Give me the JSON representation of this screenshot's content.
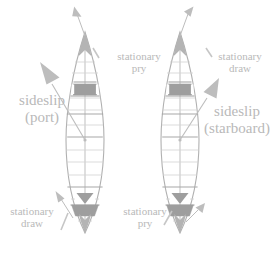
{
  "figure": {
    "colors": {
      "hull_outline": "#b0b0b0",
      "rib_line": "#c9c9c9",
      "thwart_line": "#a8a8a8",
      "seat_fill": "#9e9e9e",
      "arrow": "#bdbdbd",
      "text": "#b9b9b9",
      "background": "#ffffff"
    }
  },
  "labels": {
    "left_top": {
      "line1": "stationary",
      "line2": "pry"
    },
    "left_middle": {
      "line1": "sideslip",
      "line2": "(port)"
    },
    "left_bottom": {
      "line1": "stationary",
      "line2": "draw"
    },
    "right_top": {
      "line1": "stationary",
      "line2": "draw"
    },
    "right_middle": {
      "line1": "sideslip",
      "line2": "(starboard)"
    },
    "right_bottom": {
      "line1": "stationary",
      "line2": "pry"
    }
  },
  "canoes": [
    {
      "id": "left-canoe",
      "side": "port",
      "bow_heading": "up",
      "sideslip_direction": "up-left",
      "bow_stroke": "stationary pry",
      "stern_stroke": "stationary draw"
    },
    {
      "id": "right-canoe",
      "side": "starboard",
      "bow_heading": "up",
      "sideslip_direction": "up-right",
      "bow_stroke": "stationary draw",
      "stern_stroke": "stationary pry"
    }
  ],
  "arrows": {
    "left_momentum": {
      "name": "momentum-arrow-left",
      "direction": "up-left"
    },
    "left_sideslip": {
      "name": "sideslip-arrow-left",
      "direction": "up-left"
    },
    "left_stern": {
      "name": "stern-stroke-arrow-left",
      "direction": "up-left"
    },
    "right_momentum": {
      "name": "momentum-arrow-right",
      "direction": "up-left"
    },
    "right_sideslip": {
      "name": "sideslip-arrow-right",
      "direction": "up-right"
    },
    "right_stern": {
      "name": "stern-stroke-arrow-right",
      "direction": "up-right"
    }
  }
}
